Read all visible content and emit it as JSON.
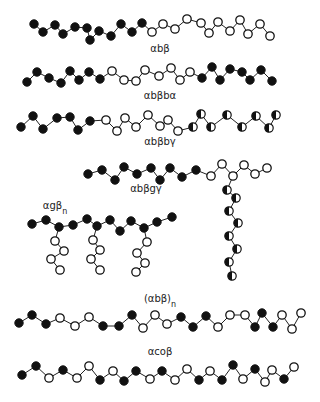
{
  "figure": {
    "bead_types": {
      "A": {
        "name": "filled",
        "color": "#111111"
      },
      "B": {
        "name": "open",
        "color": "#ffffff"
      },
      "C": {
        "name": "half-filled",
        "color": "#111111"
      }
    },
    "bead_radius": 4.2
  },
  "chains": [
    {
      "label": "αbβ",
      "label_pos": [
        160,
        52
      ],
      "beads": [
        [
          34,
          24,
          "A"
        ],
        [
          43,
          32,
          "A"
        ],
        [
          55,
          25,
          "A"
        ],
        [
          63,
          34,
          "A"
        ],
        [
          75,
          27,
          "A"
        ],
        [
          87,
          28,
          "A"
        ],
        [
          90,
          40,
          "A"
        ],
        [
          99,
          31,
          "A"
        ],
        [
          111,
          36,
          "A"
        ],
        [
          121,
          24,
          "A"
        ],
        [
          132,
          32,
          "A"
        ],
        [
          142,
          23,
          "A"
        ],
        [
          152,
          32,
          "B"
        ],
        [
          163,
          24,
          "B"
        ],
        [
          175,
          29,
          "B"
        ],
        [
          187,
          19,
          "B"
        ],
        [
          201,
          23,
          "B"
        ],
        [
          209,
          33,
          "B"
        ],
        [
          218,
          22,
          "B"
        ],
        [
          230,
          31,
          "B"
        ],
        [
          240,
          20,
          "B"
        ],
        [
          248,
          34,
          "B"
        ],
        [
          260,
          24,
          "B"
        ],
        [
          270,
          36,
          "B"
        ]
      ],
      "bonds": "sequential"
    },
    {
      "label": "αbβbα",
      "label_pos": [
        160,
        99
      ],
      "beads": [
        [
          27,
          82,
          "A"
        ],
        [
          37,
          72,
          "A"
        ],
        [
          49,
          78,
          "A"
        ],
        [
          61,
          83,
          "A"
        ],
        [
          70,
          71,
          "A"
        ],
        [
          79,
          80,
          "A"
        ],
        [
          89,
          72,
          "A"
        ],
        [
          100,
          79,
          "A"
        ],
        [
          112,
          71,
          "B"
        ],
        [
          124,
          80,
          "B"
        ],
        [
          136,
          81,
          "B"
        ],
        [
          145,
          70,
          "B"
        ],
        [
          159,
          76,
          "B"
        ],
        [
          171,
          68,
          "B"
        ],
        [
          180,
          80,
          "B"
        ],
        [
          190,
          72,
          "B"
        ],
        [
          202,
          78,
          "A"
        ],
        [
          212,
          67,
          "A"
        ],
        [
          220,
          80,
          "A"
        ],
        [
          230,
          69,
          "A"
        ],
        [
          242,
          72,
          "A"
        ],
        [
          250,
          80,
          "A"
        ],
        [
          261,
          70,
          "A"
        ],
        [
          272,
          81,
          "A"
        ]
      ],
      "bonds": "sequential"
    },
    {
      "label": "αbβbγ",
      "label_pos": [
        160,
        145
      ],
      "beads": [
        [
          21,
          127,
          "A"
        ],
        [
          33,
          116,
          "A"
        ],
        [
          43,
          129,
          "A"
        ],
        [
          57,
          118,
          "A"
        ],
        [
          70,
          117,
          "A"
        ],
        [
          78,
          130,
          "A"
        ],
        [
          90,
          121,
          "A"
        ],
        [
          106,
          120,
          "B"
        ],
        [
          117,
          131,
          "B"
        ],
        [
          125,
          118,
          "B"
        ],
        [
          136,
          127,
          "B"
        ],
        [
          148,
          115,
          "B"
        ],
        [
          160,
          126,
          "B"
        ],
        [
          168,
          120,
          "B"
        ],
        [
          178,
          131,
          "B"
        ],
        [
          193,
          127,
          "C"
        ],
        [
          201,
          114,
          "C"
        ],
        [
          211,
          127,
          "C"
        ],
        [
          227,
          115,
          "C"
        ],
        [
          242,
          127,
          "C"
        ],
        [
          256,
          116,
          "C"
        ],
        [
          269,
          128,
          "C"
        ],
        [
          276,
          115,
          "C"
        ]
      ],
      "bonds": "sequential"
    },
    {
      "label": "αbβgγ",
      "label_pos": [
        146,
        192
      ],
      "beads": [
        [
          88,
          174,
          "A"
        ],
        [
          102,
          170,
          "A"
        ],
        [
          115,
          180,
          "A"
        ],
        [
          124,
          167,
          "A"
        ],
        [
          137,
          174,
          "A"
        ],
        [
          151,
          168,
          "A"
        ],
        [
          160,
          180,
          "A"
        ],
        [
          170,
          168,
          "A"
        ],
        [
          182,
          177,
          "A"
        ],
        [
          196,
          170,
          "A"
        ],
        [
          211,
          176,
          "B"
        ],
        [
          222,
          164,
          "B"
        ],
        [
          233,
          176,
          "B"
        ],
        [
          244,
          165,
          "B"
        ],
        [
          255,
          174,
          "B"
        ],
        [
          267,
          168,
          "B"
        ],
        [
          227,
          190,
          "C"
        ],
        [
          236,
          198,
          "C"
        ],
        [
          229,
          211,
          "C"
        ],
        [
          238,
          223,
          "C"
        ],
        [
          229,
          236,
          "C"
        ],
        [
          237,
          249,
          "C"
        ],
        [
          229,
          262,
          "C"
        ],
        [
          232,
          276,
          "C"
        ]
      ],
      "bonds_list": [
        [
          0,
          1
        ],
        [
          1,
          2
        ],
        [
          2,
          3
        ],
        [
          3,
          4
        ],
        [
          4,
          5
        ],
        [
          5,
          6
        ],
        [
          6,
          7
        ],
        [
          7,
          8
        ],
        [
          8,
          9
        ],
        [
          9,
          10
        ],
        [
          10,
          11
        ],
        [
          11,
          12
        ],
        [
          12,
          13
        ],
        [
          13,
          14
        ],
        [
          14,
          15
        ],
        [
          12,
          16
        ],
        [
          16,
          17
        ],
        [
          17,
          18
        ],
        [
          18,
          19
        ],
        [
          19,
          20
        ],
        [
          20,
          21
        ],
        [
          21,
          22
        ],
        [
          22,
          23
        ]
      ]
    },
    {
      "label": "αgβn",
      "label_text": "αgβ",
      "label_sub": "n",
      "label_pos": [
        55,
        209
      ],
      "beads": [
        [
          32,
          224,
          "A"
        ],
        [
          46,
          220,
          "A"
        ],
        [
          59,
          227,
          "A"
        ],
        [
          73,
          225,
          "A"
        ],
        [
          87,
          219,
          "A"
        ],
        [
          97,
          226,
          "A"
        ],
        [
          110,
          220,
          "A"
        ],
        [
          120,
          231,
          "A"
        ],
        [
          131,
          221,
          "A"
        ],
        [
          144,
          228,
          "A"
        ],
        [
          157,
          222,
          "A"
        ],
        [
          172,
          217,
          "A"
        ],
        [
          55,
          241,
          "B"
        ],
        [
          64,
          251,
          "B"
        ],
        [
          51,
          259,
          "B"
        ],
        [
          60,
          270,
          "B"
        ],
        [
          93,
          240,
          "B"
        ],
        [
          100,
          250,
          "B"
        ],
        [
          91,
          259,
          "B"
        ],
        [
          100,
          270,
          "B"
        ],
        [
          147,
          242,
          "B"
        ],
        [
          137,
          253,
          "B"
        ],
        [
          145,
          263,
          "B"
        ],
        [
          136,
          272,
          "B"
        ]
      ],
      "bonds_list": [
        [
          0,
          1
        ],
        [
          1,
          2
        ],
        [
          2,
          3
        ],
        [
          3,
          4
        ],
        [
          4,
          5
        ],
        [
          5,
          6
        ],
        [
          6,
          7
        ],
        [
          7,
          8
        ],
        [
          8,
          9
        ],
        [
          9,
          10
        ],
        [
          10,
          11
        ],
        [
          2,
          12
        ],
        [
          12,
          13
        ],
        [
          13,
          14
        ],
        [
          14,
          15
        ],
        [
          5,
          16
        ],
        [
          16,
          17
        ],
        [
          17,
          18
        ],
        [
          18,
          19
        ],
        [
          9,
          20
        ],
        [
          20,
          21
        ],
        [
          21,
          22
        ],
        [
          22,
          23
        ]
      ]
    },
    {
      "label": "(αbβ)n",
      "label_text": "(αbβ)",
      "label_sub": "n",
      "label_pos": [
        160,
        302
      ],
      "beads": [
        [
          19,
          323,
          "A"
        ],
        [
          32,
          315,
          "A"
        ],
        [
          46,
          324,
          "A"
        ],
        [
          60,
          318,
          "B"
        ],
        [
          75,
          326,
          "B"
        ],
        [
          89,
          317,
          "B"
        ],
        [
          103,
          326,
          "A"
        ],
        [
          119,
          326,
          "A"
        ],
        [
          132,
          315,
          "A"
        ],
        [
          143,
          328,
          "B"
        ],
        [
          155,
          315,
          "B"
        ],
        [
          167,
          324,
          "B"
        ],
        [
          181,
          317,
          "A"
        ],
        [
          193,
          327,
          "A"
        ],
        [
          206,
          316,
          "A"
        ],
        [
          218,
          327,
          "B"
        ],
        [
          230,
          315,
          "B"
        ],
        [
          245,
          315,
          "B"
        ],
        [
          255,
          327,
          "A"
        ],
        [
          262,
          313,
          "A"
        ],
        [
          273,
          327,
          "A"
        ],
        [
          282,
          315,
          "B"
        ],
        [
          292,
          329,
          "B"
        ],
        [
          301,
          313,
          "B"
        ]
      ],
      "bonds": "sequential"
    },
    {
      "label": "αcoβ",
      "label_pos": [
        160,
        355
      ],
      "beads": [
        [
          22,
          375,
          "A"
        ],
        [
          36,
          366,
          "A"
        ],
        [
          49,
          378,
          "B"
        ],
        [
          63,
          370,
          "A"
        ],
        [
          77,
          378,
          "B"
        ],
        [
          89,
          366,
          "B"
        ],
        [
          100,
          380,
          "A"
        ],
        [
          113,
          371,
          "B"
        ],
        [
          124,
          381,
          "A"
        ],
        [
          136,
          371,
          "A"
        ],
        [
          150,
          379,
          "B"
        ],
        [
          162,
          371,
          "A"
        ],
        [
          175,
          380,
          "B"
        ],
        [
          187,
          369,
          "B"
        ],
        [
          199,
          380,
          "A"
        ],
        [
          210,
          371,
          "B"
        ],
        [
          222,
          380,
          "A"
        ],
        [
          233,
          365,
          "A"
        ],
        [
          243,
          379,
          "B"
        ],
        [
          255,
          369,
          "A"
        ],
        [
          265,
          382,
          "B"
        ],
        [
          272,
          370,
          "B"
        ],
        [
          284,
          379,
          "A"
        ],
        [
          294,
          367,
          "B"
        ]
      ],
      "bonds": "sequential"
    }
  ]
}
